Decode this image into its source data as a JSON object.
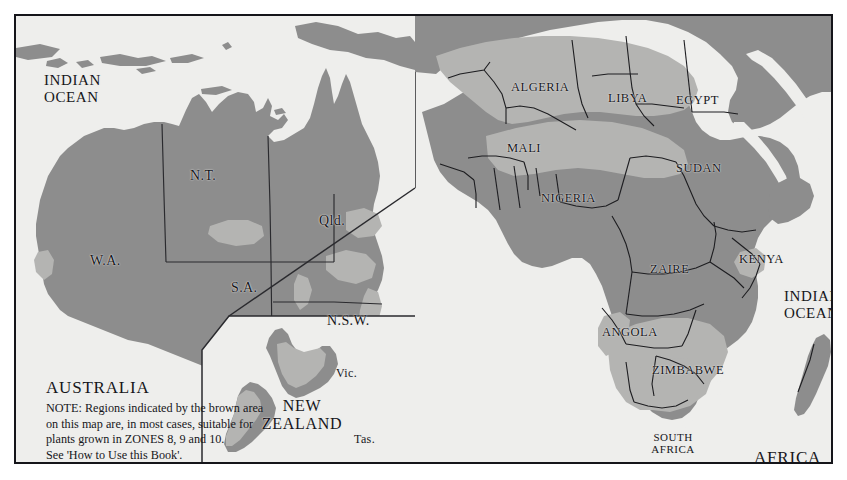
{
  "map": {
    "title": "Climate Zone Map - Australia, New Zealand and Africa",
    "colors": {
      "background": "#eeeeec",
      "ocean": "#eeeeec",
      "land": "#8d8d8d",
      "zone_highlight": "#b4b4b2",
      "border_line": "#1d1d20",
      "frame": "#15151a",
      "text": "#16161a"
    }
  },
  "panels": {
    "australia": {
      "name": "AUSTRALIA",
      "ocean_label": "INDIAN\nOCEAN",
      "states": [
        {
          "label": "N.T.",
          "x": 188,
          "y": 160
        },
        {
          "label": "W.A.",
          "x": 88,
          "y": 245
        },
        {
          "label": "Qld.",
          "x": 318,
          "y": 205
        },
        {
          "label": "S.A.",
          "x": 228,
          "y": 272
        },
        {
          "label": "N.S.W.",
          "x": 330,
          "y": 305
        },
        {
          "label": "Vic.",
          "x": 333,
          "y": 358
        },
        {
          "label": "Tas.",
          "x": 349,
          "y": 424
        }
      ],
      "note": {
        "heading": "AUSTRALIA",
        "lines": [
          "NOTE: Regions indicated by the brown area",
          "on this map are, in most cases, suitable for",
          "plants grown in ZONES 8, 9 and 10.",
          "See 'How to Use this Book'."
        ]
      }
    },
    "new_zealand": {
      "name": "NEW\nZEALAND"
    },
    "africa": {
      "name": "AFRICA",
      "ocean_label": "INDIAN\nOCEAN",
      "countries": [
        {
          "label": "ALGERIA",
          "x": 525,
          "y": 72
        },
        {
          "label": "LIBYA",
          "x": 614,
          "y": 82
        },
        {
          "label": "EGYPT",
          "x": 679,
          "y": 85
        },
        {
          "label": "MALI",
          "x": 512,
          "y": 132
        },
        {
          "label": "SUDAN",
          "x": 680,
          "y": 152
        },
        {
          "label": "NIGERIA",
          "x": 554,
          "y": 182
        },
        {
          "label": "ZAIRE",
          "x": 650,
          "y": 253
        },
        {
          "label": "KENYA",
          "x": 730,
          "y": 243
        },
        {
          "label": "ANGOLA",
          "x": 610,
          "y": 316
        },
        {
          "label": "ZIMBABWE",
          "x": 672,
          "y": 354
        },
        {
          "label": "SOUTH\nAFRICA",
          "x": 645,
          "y": 424
        }
      ]
    }
  }
}
